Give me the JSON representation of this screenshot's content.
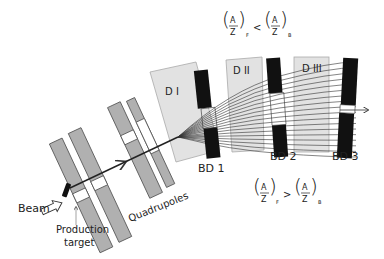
{
  "labels": {
    "beam": "Beam",
    "production_target_line1": "Production",
    "production_target_line2": "target",
    "quadrupoles": "Quadrupoles",
    "dipoles": [
      "D I",
      "D II",
      "D III"
    ],
    "degraders": [
      "BD 1",
      "BD 2",
      "BD 3"
    ]
  },
  "formulas": {
    "top": {
      "num": "A",
      "den": "Z",
      "sub_left": "F",
      "op": "<",
      "sub_right": "B"
    },
    "bottom": {
      "num": "A",
      "den": "Z",
      "sub_left": "F",
      "op": ">",
      "sub_right": "B"
    }
  },
  "colors": {
    "quadrupole_fill": "#b0b0b0",
    "dipole_fill": "#e2e2e2",
    "degrader_fill": "#111111",
    "line": "#333333"
  }
}
